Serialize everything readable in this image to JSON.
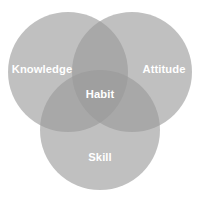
{
  "diagram": {
    "type": "venn",
    "set_count": 3,
    "background_color": "#ffffff",
    "circle_fill_color": "#9a9a9a",
    "circle_fill_opacity": 0.62,
    "single_region_color": "#a9a9a9",
    "double_overlap_color": "#888888",
    "triple_overlap_color": "#6e6e6e",
    "label_color": "#ffffff",
    "circles": [
      {
        "name": "knowledge",
        "label": "Knowledge",
        "cx": 68,
        "cy": 72,
        "r": 60
      },
      {
        "name": "attitude",
        "label": "Attitude",
        "cx": 132,
        "cy": 72,
        "r": 60
      },
      {
        "name": "skill",
        "label": "Skill",
        "cx": 100,
        "cy": 130,
        "r": 60
      }
    ],
    "intersection": {
      "name": "habit",
      "label": "Habit"
    },
    "labels": {
      "knowledge": "Knowledge",
      "attitude": "Attitude",
      "skill": "Skill",
      "habit": "Habit"
    }
  }
}
